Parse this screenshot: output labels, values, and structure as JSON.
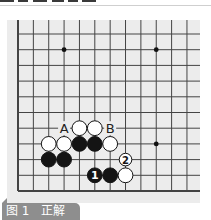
{
  "caption": {
    "label": "图 1　正解"
  },
  "board": {
    "background": "#ececec",
    "line_color": "#444444",
    "grid_origin": [
      18,
      34
    ],
    "col_spacing": 15.36,
    "row_spacing": 15.7,
    "cols": 12,
    "rows": 11,
    "left_edge": true,
    "bottom_edge": true,
    "star_points": [
      [
        3,
        1
      ],
      [
        9,
        1
      ],
      [
        9,
        7
      ]
    ],
    "stones": [
      {
        "color": "white",
        "col": 4,
        "row": 6
      },
      {
        "color": "white",
        "col": 5,
        "row": 6
      },
      {
        "color": "white",
        "col": 2,
        "row": 7
      },
      {
        "color": "white",
        "col": 3,
        "row": 7
      },
      {
        "color": "black",
        "col": 4,
        "row": 7
      },
      {
        "color": "black",
        "col": 5,
        "row": 7
      },
      {
        "color": "white",
        "col": 6,
        "row": 7
      },
      {
        "color": "black",
        "col": 2,
        "row": 8
      },
      {
        "color": "black",
        "col": 3,
        "row": 8
      },
      {
        "color": "black",
        "col": 5,
        "row": 9,
        "label": "1"
      },
      {
        "color": "black",
        "col": 6,
        "row": 9
      },
      {
        "color": "white",
        "col": 7,
        "row": 9
      },
      {
        "color": "white",
        "col": 7,
        "row": 8,
        "label": "2",
        "small": true
      }
    ],
    "marks": [
      {
        "label": "A",
        "col": 3,
        "row": 6
      },
      {
        "label": "B",
        "col": 6,
        "row": 6
      }
    ]
  }
}
